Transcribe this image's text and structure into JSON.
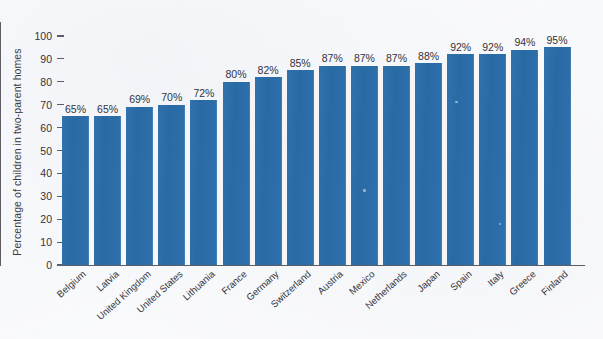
{
  "chart_data": {
    "type": "bar",
    "title": "",
    "xlabel": "",
    "ylabel": "Percentage of children in two-parent homes",
    "ylim": [
      0,
      100
    ],
    "yticks": [
      0,
      10,
      20,
      30,
      40,
      50,
      60,
      70,
      80,
      90,
      100
    ],
    "ytick_labels": [
      "0",
      "10",
      "20",
      "30",
      "40",
      "50",
      "60",
      "70",
      "80",
      "90",
      "100"
    ],
    "grid": false,
    "legend": false,
    "legend_position": "none",
    "value_suffix": "%",
    "bar_color": "#2c6ca8",
    "categories": [
      "Belgium",
      "Latvia",
      "United Kingdom",
      "United States",
      "Lithuania",
      "France",
      "Germany",
      "Switzerland",
      "Austria",
      "Mexico",
      "Netherlands",
      "Japan",
      "Spain",
      "Italy",
      "Greece",
      "Finland"
    ],
    "values": [
      65,
      65,
      69,
      70,
      72,
      80,
      82,
      85,
      87,
      87,
      87,
      88,
      92,
      92,
      94,
      95
    ],
    "data_labels": [
      "65%",
      "65%",
      "69%",
      "70%",
      "72%",
      "80%",
      "82%",
      "85%",
      "87%",
      "87%",
      "87%",
      "88%",
      "92%",
      "92%",
      "94%",
      "95%"
    ]
  }
}
